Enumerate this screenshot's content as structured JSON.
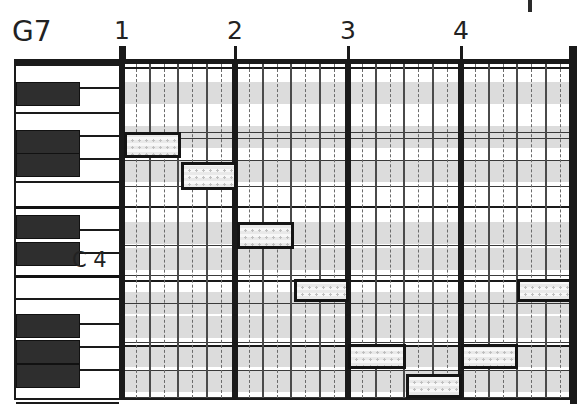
{
  "header": {
    "chord_label": "G7"
  },
  "ruler": {
    "measure_numbers": [
      "1",
      "2",
      "3",
      "4"
    ],
    "measure_x": [
      122,
      235,
      348,
      461
    ],
    "end_x": 572,
    "top_stub_x": 530
  },
  "keyboard": {
    "c_label": "C 4",
    "c_label_x": 72,
    "c_label_y": 250,
    "white_key_boundaries": [
      62,
      85,
      110,
      133,
      156,
      179,
      204,
      227,
      250,
      273,
      296,
      321,
      344,
      367,
      400
    ],
    "octave_boundaries": [
      204,
      273
    ],
    "black_keys": [
      {
        "name": "A#5",
        "top": 80,
        "height": 24
      },
      {
        "name": "G#5",
        "top": 128,
        "height": 24
      },
      {
        "name": "F#5",
        "top": 151,
        "height": 24
      },
      {
        "name": "D#5",
        "top": 213,
        "height": 24
      },
      {
        "name": "C#5",
        "top": 240,
        "height": 24
      },
      {
        "name": "A#4",
        "top": 312,
        "height": 24
      },
      {
        "name": "G#4",
        "top": 338,
        "height": 24
      },
      {
        "name": "F#4",
        "top": 362,
        "height": 24
      }
    ]
  },
  "grid": {
    "left": 121,
    "top": 62,
    "width": 453,
    "height": 338,
    "black_row_color": "#dcdcdc",
    "white_row_color": "#ffffff",
    "row_lines": [
      3,
      68,
      74,
      96,
      122,
      142,
      181,
      211,
      216,
      239,
      278,
      281,
      306,
      333
    ],
    "strong_row_lines": [
      3,
      142,
      216,
      281
    ],
    "black_key_bands": [
      {
        "top": 18,
        "height": 22
      },
      {
        "top": 62,
        "height": 22
      },
      {
        "top": 96,
        "height": 22
      },
      {
        "top": 158,
        "height": 22
      },
      {
        "top": 184,
        "height": 22
      },
      {
        "top": 228,
        "height": 22
      },
      {
        "top": 252,
        "height": 22
      },
      {
        "top": 281,
        "height": 22
      },
      {
        "top": 306,
        "height": 22
      }
    ],
    "bar_lines_x": [
      1,
      114,
      227,
      340,
      451
    ],
    "beat_lines_x": [
      29,
      57,
      86,
      142,
      170,
      199,
      255,
      283,
      312,
      368,
      396,
      425
    ],
    "sub_lines_x": [
      15,
      43,
      71,
      100,
      128,
      156,
      184,
      213,
      241,
      269,
      297,
      326,
      354,
      382,
      410,
      439
    ]
  },
  "chart_data": {
    "type": "piano-roll",
    "title": "G7",
    "xlabel": "measures",
    "ylabel": "pitch",
    "tonic_reference": "C 4",
    "measures": 4,
    "beats_per_measure": 4,
    "notes": [
      {
        "index": 1,
        "start_measure": 1,
        "start_beat": 1,
        "duration_beats": 2,
        "x": 124,
        "y": 130,
        "w": 57,
        "h": 26,
        "pitch": "F5"
      },
      {
        "index": 2,
        "start_measure": 1,
        "start_beat": 3,
        "duration_beats": 2,
        "x": 181,
        "y": 160,
        "w": 56,
        "h": 28,
        "pitch": "D5"
      },
      {
        "index": 3,
        "start_measure": 2,
        "start_beat": 1,
        "duration_beats": 2,
        "x": 237,
        "y": 220,
        "w": 57,
        "h": 27,
        "pitch": "B4"
      },
      {
        "index": 4,
        "start_measure": 2,
        "start_beat": 3,
        "duration_beats": 2,
        "x": 294,
        "y": 277,
        "w": 55,
        "h": 23,
        "pitch": "G4"
      },
      {
        "index": 5,
        "start_measure": 3,
        "start_beat": 1,
        "duration_beats": 2,
        "x": 348,
        "y": 342,
        "w": 58,
        "h": 25,
        "pitch": "D4"
      },
      {
        "index": 6,
        "start_measure": 3,
        "start_beat": 3,
        "duration_beats": 2,
        "x": 406,
        "y": 372,
        "w": 56,
        "h": 24,
        "pitch": "B3"
      },
      {
        "index": 7,
        "start_measure": 4,
        "start_beat": 1,
        "duration_beats": 2,
        "x": 461,
        "y": 342,
        "w": 57,
        "h": 25,
        "pitch": "D4"
      },
      {
        "index": 8,
        "start_measure": 4,
        "start_beat": 3,
        "duration_beats": 2,
        "x": 517,
        "y": 277,
        "w": 55,
        "h": 23,
        "pitch": "G4"
      }
    ]
  }
}
